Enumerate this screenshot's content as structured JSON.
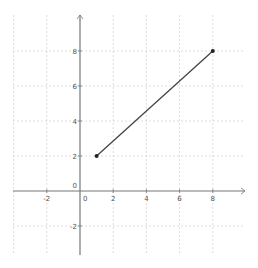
{
  "chart_data": {
    "type": "line",
    "title": "",
    "xlabel": "",
    "ylabel": "",
    "xlim": [
      -4.0,
      9.8
    ],
    "ylim": [
      -3.7,
      10
    ],
    "grid": true,
    "x_ticks": [
      -2,
      0,
      2,
      4,
      6,
      8
    ],
    "y_ticks": [
      -2,
      0,
      2,
      4,
      6,
      8
    ],
    "x_tick_labels": [
      "-2",
      "0",
      "2",
      "4",
      "6",
      "8"
    ],
    "y_tick_labels": [
      "-2",
      "0",
      "2",
      "4",
      "6",
      "8"
    ],
    "series": [
      {
        "name": "segment",
        "points": [
          [
            1,
            2
          ],
          [
            8,
            8
          ]
        ],
        "color": "#444444",
        "markers": true
      }
    ]
  },
  "colors": {
    "axis": "#777777",
    "grid": "#d0d0d0",
    "line": "#444444",
    "point": "#222222"
  }
}
